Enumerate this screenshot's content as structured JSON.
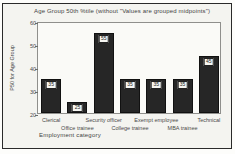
{
  "chart_data": {
    "type": "bar",
    "title": "Age Group 50th %tile (without \"Values are grouped midpoints\")",
    "xlabel": "Employment category",
    "ylabel": "P50 for Age Group",
    "categories": [
      "Clerical",
      "Office trainee",
      "Security officer",
      "College trainee",
      "Exempt employee",
      "MBA trainee",
      "Technical"
    ],
    "values": [
      35,
      25,
      55,
      35,
      35,
      35,
      45
    ],
    "bar_value_labels": [
      "35",
      "25",
      "55",
      "35",
      "35",
      "35",
      "45"
    ],
    "ylim": [
      20,
      60
    ],
    "yticks": [
      20,
      30,
      40,
      50,
      60
    ],
    "grid": false,
    "legend": "none",
    "label_layout": "staggered-two-rows",
    "colors": {
      "bar": "#262626",
      "value_label_bg": "#f6f6f2",
      "plot_border": "#8f8f8c",
      "page_border": "#2a2a2a",
      "background": "#f4f4f0",
      "text": "#3a3a3a"
    }
  }
}
